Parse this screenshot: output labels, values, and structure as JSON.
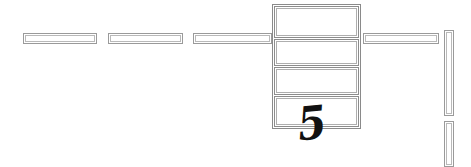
{
  "drawing": {
    "title": "Architectural plan fragment",
    "background_color": "#ffffff",
    "line_color": "#9a9a9a",
    "inner_line_color": "#b9b9b9",
    "annotation_color": "#111111",
    "width": 471,
    "height": 167
  },
  "annotation": {
    "label": "5",
    "font_size": "46px",
    "x": 296,
    "y": 100
  },
  "horizontal_walls": [
    {
      "name": "wall-segment-1",
      "x": 23,
      "y": 33,
      "width": 74,
      "height": 11
    },
    {
      "name": "wall-segment-2",
      "x": 108,
      "y": 33,
      "width": 75,
      "height": 11
    },
    {
      "name": "wall-segment-3",
      "x": 193,
      "y": 33,
      "width": 79,
      "height": 11
    },
    {
      "name": "wall-segment-4",
      "x": 363,
      "y": 33,
      "width": 76,
      "height": 11
    }
  ],
  "vertical_walls": [
    {
      "name": "wall-segment-5",
      "x": 444,
      "y": 30,
      "width": 10,
      "height": 86
    },
    {
      "name": "wall-segment-6",
      "x": 444,
      "y": 121,
      "width": 10,
      "height": 46
    }
  ],
  "central_unit": {
    "name": "stacked-panel-unit",
    "frame": {
      "x": 272,
      "y": 4,
      "width": 89,
      "height": 125
    },
    "panels": [
      {
        "name": "panel-1",
        "x": 274,
        "y": 6,
        "width": 85,
        "height": 32
      },
      {
        "name": "panel-2",
        "x": 274,
        "y": 39,
        "width": 85,
        "height": 27
      },
      {
        "name": "panel-3",
        "x": 274,
        "y": 67,
        "width": 85,
        "height": 28
      },
      {
        "name": "panel-4",
        "x": 274,
        "y": 96,
        "width": 85,
        "height": 31
      }
    ]
  }
}
